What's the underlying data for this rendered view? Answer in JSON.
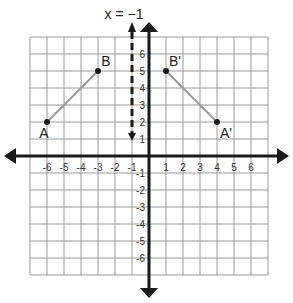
{
  "diagram": {
    "type": "coordinate-plane-reflection",
    "reflection_line": {
      "label": "x = −1",
      "x": -1,
      "style": "dashed"
    },
    "grid": {
      "x_min": -7,
      "x_max": 7,
      "y_min": -7,
      "y_max": 7,
      "grid_color": "#9a9a9a",
      "axis_color": "#1a1a1a",
      "segment_color": "#9a9a9a"
    },
    "x_tick_labels": [
      "-6",
      "-5",
      "-4",
      "-3",
      "-2",
      "-1",
      "1",
      "2",
      "3",
      "4",
      "5",
      "6"
    ],
    "x_tick_values": [
      -6,
      -5,
      -4,
      -3,
      -2,
      -1,
      1,
      2,
      3,
      4,
      5,
      6
    ],
    "y_tick_labels": [
      "6",
      "5",
      "4",
      "3",
      "2",
      "1",
      "-1",
      "-2",
      "-3",
      "-4",
      "-5",
      "-6"
    ],
    "y_tick_values": [
      6,
      5,
      4,
      3,
      2,
      1,
      -1,
      -2,
      -3,
      -4,
      -5,
      -6
    ],
    "points": [
      {
        "label": "A",
        "x": -6,
        "y": 2
      },
      {
        "label": "B",
        "x": -3,
        "y": 5
      },
      {
        "label": "B'",
        "x": 1,
        "y": 5
      },
      {
        "label": "A'",
        "x": 4,
        "y": 2
      }
    ],
    "segments": [
      {
        "from": "A",
        "to": "B"
      },
      {
        "from": "B'",
        "to": "A'"
      }
    ]
  }
}
